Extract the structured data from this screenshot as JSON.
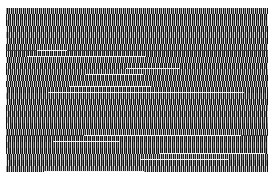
{
  "image": {
    "description": "Dense, illegible noisy rows resembling scrambled small text",
    "legible_text": "",
    "content_bounds": {
      "x": 6,
      "y": 8,
      "width": 262,
      "height": 164
    },
    "row_count": 27,
    "colors": {
      "background": "#ffffff",
      "dark": "#111111",
      "mid": "#3a3a3a",
      "light": "#dcdcdc",
      "streak": "#f4f4f4"
    }
  }
}
